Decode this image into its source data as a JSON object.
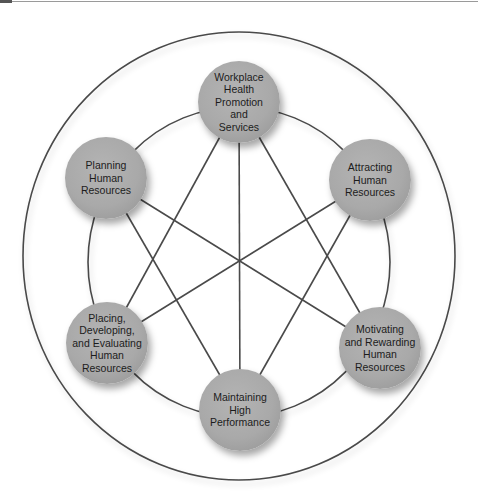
{
  "diagram": {
    "type": "star-network",
    "colors": {
      "line": "#4a4a4a",
      "node_fill": "#a9a9a9",
      "text": "#1c1c1c",
      "background": "#ffffff"
    },
    "nodes": [
      {
        "id": "workplace",
        "label": "Workplace\nHealth\nPromotion\nand\nServices",
        "cx": 239,
        "cy": 102
      },
      {
        "id": "attracting",
        "label": "Attracting\nHuman\nResources",
        "cx": 370,
        "cy": 180
      },
      {
        "id": "motivating",
        "label": "Motivating\nand Rewarding\nHuman\nResources",
        "cx": 380,
        "cy": 348
      },
      {
        "id": "maintaining",
        "label": "Maintaining\nHigh\nPerformance",
        "cx": 240,
        "cy": 410
      },
      {
        "id": "placing",
        "label": "Placing,\nDeveloping,\nand Evaluating\nHuman\nResources",
        "cx": 107,
        "cy": 343
      },
      {
        "id": "planning",
        "label": "Planning\nHuman\nResources",
        "cx": 106,
        "cy": 178
      }
    ],
    "connections": [
      [
        "workplace",
        "maintaining"
      ],
      [
        "workplace",
        "placing"
      ],
      [
        "workplace",
        "motivating"
      ],
      [
        "planning",
        "motivating"
      ],
      [
        "planning",
        "maintaining"
      ],
      [
        "attracting",
        "placing"
      ],
      [
        "attracting",
        "maintaining"
      ]
    ]
  }
}
